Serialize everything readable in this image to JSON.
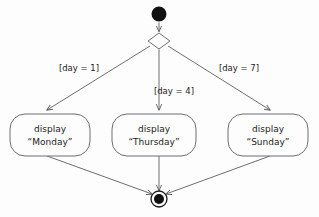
{
  "diagram": {
    "type": "uml-activity-diagram",
    "title": "",
    "background_color": "#fdfdfd",
    "stroke_color": "#6e6e72",
    "text_color": "#1c1c1c",
    "node_fill_color": "#121212",
    "nodes": {
      "initial": {
        "name": "initial-node",
        "shape": "filled-circle",
        "cx": 159,
        "cy": 14,
        "r": 7.5
      },
      "decision": {
        "name": "decision-node",
        "shape": "diamond",
        "cx": 159,
        "cy": 41,
        "half_width": 11,
        "half_height": 8
      },
      "final": {
        "name": "final-node",
        "shape": "bullseye",
        "cx": 159,
        "cy": 199,
        "outer_r": 8,
        "inner_r": 5
      }
    },
    "activities": [
      {
        "id": "monday",
        "line1": "display",
        "line2": "“Monday”",
        "x": 10,
        "y": 114,
        "width": 80,
        "height": 42
      },
      {
        "id": "thursday",
        "line1": "display",
        "line2": "“Thursday”",
        "x": 112,
        "y": 114,
        "width": 84,
        "height": 42
      },
      {
        "id": "sunday",
        "line1": "display",
        "line2": "“Sunday”",
        "x": 228,
        "y": 114,
        "width": 80,
        "height": 42
      }
    ],
    "guards": [
      {
        "id": "guard-day-1",
        "label": "[day = 1]",
        "x": 79,
        "y": 71
      },
      {
        "id": "guard-day-4",
        "label": "[day = 4]",
        "x": 174,
        "y": 94
      },
      {
        "id": "guard-day-7",
        "label": "[day = 7]",
        "x": 239,
        "y": 71
      }
    ],
    "edges": [
      {
        "id": "edge-initial-to-decision",
        "from": "initial",
        "to": "decision",
        "arrow": true
      },
      {
        "id": "edge-decision-to-monday",
        "from": "decision",
        "to": "monday",
        "arrow": true,
        "guard": "[day = 1]"
      },
      {
        "id": "edge-decision-to-thursday",
        "from": "decision",
        "to": "thursday",
        "arrow": true,
        "guard": "[day = 4]"
      },
      {
        "id": "edge-decision-to-sunday",
        "from": "decision",
        "to": "sunday",
        "arrow": true,
        "guard": "[day = 7]"
      },
      {
        "id": "edge-monday-to-final",
        "from": "monday",
        "to": "final",
        "arrow": true
      },
      {
        "id": "edge-thursday-to-final",
        "from": "thursday",
        "to": "final",
        "arrow": true
      },
      {
        "id": "edge-sunday-to-final",
        "from": "sunday",
        "to": "final",
        "arrow": true
      }
    ]
  }
}
